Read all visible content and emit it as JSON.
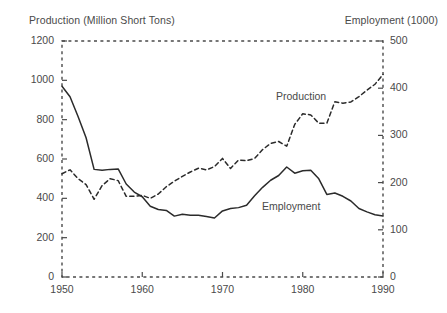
{
  "chart_data": {
    "type": "line",
    "title": "",
    "subtitle": "",
    "xlabel": "",
    "ylabel": "Production (Million Short Tons)",
    "y2label": "Employment (1000)",
    "xlim": [
      1950,
      1990
    ],
    "ylim": [
      0,
      1200
    ],
    "y2lim": [
      0,
      500
    ],
    "grid": false,
    "legend_position": "inline-annotation",
    "x_ticks": [
      "1950",
      "1960",
      "1970",
      "1980",
      "1990"
    ],
    "x_tick_values": [
      1950,
      1960,
      1970,
      1980,
      1990
    ],
    "y_ticks_left": [
      "0",
      "200",
      "400",
      "600",
      "800",
      "1000",
      "1200"
    ],
    "y_tick_values_left": [
      0,
      200,
      400,
      600,
      800,
      1000,
      1200
    ],
    "y_ticks_right": [
      "0",
      "100",
      "200",
      "300",
      "400",
      "500"
    ],
    "y_tick_values_right": [
      0,
      100,
      200,
      300,
      400,
      500
    ],
    "annotations": [
      {
        "name": "production-annotation",
        "text": "Production",
        "x": 1977,
        "y": 880
      },
      {
        "name": "employment-annotation",
        "text": "Employment",
        "x": 1972,
        "y": 330
      }
    ],
    "x": [
      1950,
      1951,
      1952,
      1953,
      1954,
      1955,
      1956,
      1957,
      1958,
      1959,
      1960,
      1961,
      1962,
      1963,
      1964,
      1965,
      1966,
      1967,
      1968,
      1969,
      1970,
      1971,
      1972,
      1973,
      1974,
      1975,
      1976,
      1977,
      1978,
      1979,
      1980,
      1981,
      1982,
      1983,
      1984,
      1985,
      1986,
      1987,
      1988,
      1989,
      1990
    ],
    "series": [
      {
        "name": "Production",
        "axis": "left",
        "unit": "Million Short Tons",
        "style": "dashed",
        "values": [
          525,
          545,
          500,
          470,
          395,
          465,
          500,
          490,
          410,
          410,
          415,
          400,
          422,
          459,
          487,
          512,
          534,
          553,
          545,
          561,
          603,
          552,
          595,
          591,
          603,
          648,
          679,
          689,
          665,
          776,
          830,
          824,
          782,
          782,
          891,
          884,
          890,
          917,
          950,
          980,
          1030
        ]
      },
      {
        "name": "Employment",
        "axis": "right",
        "unit": "1000",
        "style": "solid",
        "values": [
          404,
          382,
          340,
          295,
          228,
          226,
          228,
          229,
          197,
          180,
          170,
          150,
          143,
          141,
          129,
          133,
          131,
          131,
          128,
          125,
          140,
          145,
          147,
          152,
          172,
          190,
          205,
          215,
          233,
          220,
          225,
          226,
          208,
          175,
          178,
          171,
          161,
          145,
          138,
          132,
          129
        ]
      }
    ]
  },
  "axis_titles": {
    "left": "Production (Million Short Tons)",
    "right": "Employment (1000)"
  },
  "series_labels": {
    "production": "Production",
    "employment": "Employment"
  },
  "colors": {
    "line": "#2b2b2b",
    "frame": "#4a4a4a",
    "text": "#4a4a4a",
    "background": "#ffffff"
  }
}
